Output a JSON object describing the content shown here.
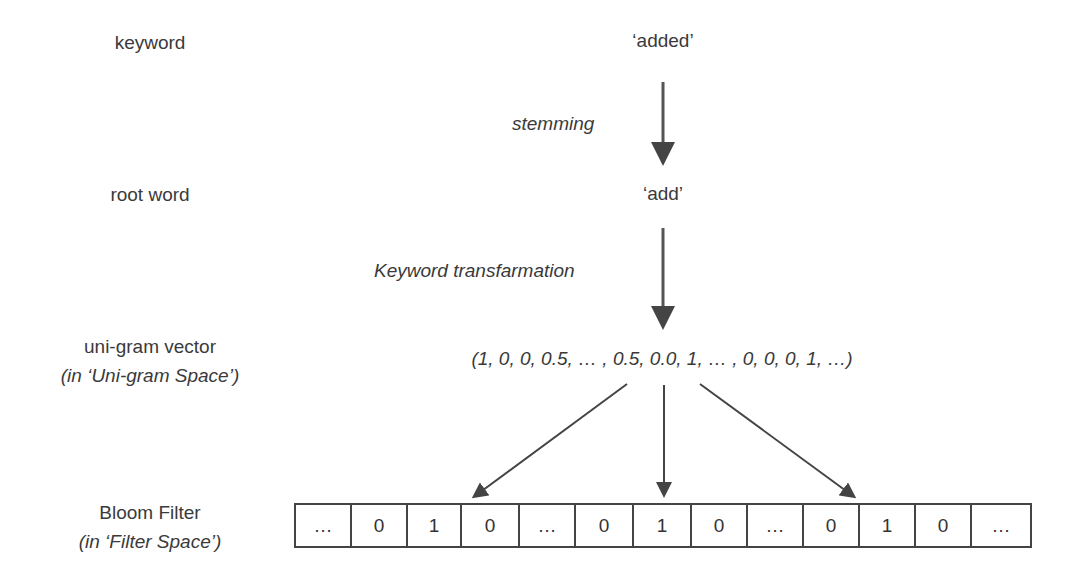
{
  "left_labels": {
    "keyword": "keyword",
    "root_word": "root word",
    "unigram_vector": "uni-gram vector",
    "unigram_space": "(in ‘Uni-gram Space’)",
    "bloom_filter": "Bloom Filter",
    "filter_space": "(in ‘Filter Space’)"
  },
  "flow": {
    "keyword_value": "‘added’",
    "step1_label": "stemming",
    "root_value": "‘add’",
    "step2_label": "Keyword transfarmation",
    "vector_value": "(1, 0, 0, 0.5, … , 0.5, 0.0, 1, … , 0, 0, 0, 1, …)"
  },
  "bloom_filter": {
    "cells": [
      "…",
      "0",
      "1",
      "0",
      "…",
      "0",
      "1",
      "0",
      "…",
      "0",
      "1",
      "0",
      "…"
    ]
  },
  "colors": {
    "text": "#3a3a3a",
    "arrow": "#444444",
    "border": "#444444"
  }
}
